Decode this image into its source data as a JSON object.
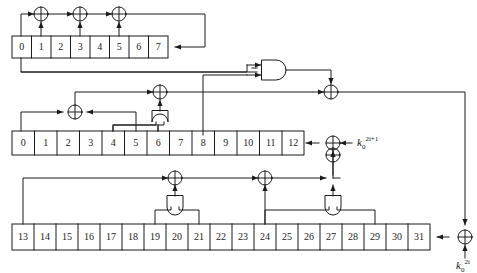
{
  "diagram": {
    "stroke_color": "#1a1a1a",
    "background": "#ffffff",
    "registers": [
      {
        "name": "top-register",
        "cells": [
          "0",
          "1",
          "2",
          "3",
          "4",
          "5",
          "6",
          "7"
        ]
      },
      {
        "name": "middle-register",
        "cells": [
          "0",
          "1",
          "2",
          "3",
          "4",
          "5",
          "6",
          "7",
          "8",
          "9",
          "10",
          "11",
          "12"
        ]
      },
      {
        "name": "bottom-register",
        "cells": [
          "13",
          "14",
          "15",
          "16",
          "17",
          "18",
          "19",
          "20",
          "21",
          "22",
          "23",
          "24",
          "25",
          "26",
          "27",
          "28",
          "29",
          "30",
          "31"
        ]
      }
    ],
    "gates": [
      {
        "name": "xor-top-1",
        "type": "xor",
        "symbol": "+"
      },
      {
        "name": "xor-top-2",
        "type": "xor",
        "symbol": "+"
      },
      {
        "name": "xor-top-3",
        "type": "xor",
        "symbol": "+"
      },
      {
        "name": "xor-middle-left",
        "type": "xor",
        "symbol": "+"
      },
      {
        "name": "xor-middle-center",
        "type": "xor",
        "symbol": "+"
      },
      {
        "name": "xor-middle-right",
        "type": "xor",
        "symbol": "+"
      },
      {
        "name": "xor-key-odd",
        "type": "xor",
        "symbol": "+"
      },
      {
        "name": "xor-bottom-left",
        "type": "xor",
        "symbol": "+"
      },
      {
        "name": "xor-bottom-center",
        "type": "xor",
        "symbol": "+"
      },
      {
        "name": "xor-bottom-right",
        "type": "xor",
        "symbol": "+"
      },
      {
        "name": "xor-key-even",
        "type": "xor",
        "symbol": "+"
      },
      {
        "name": "and-gate-top",
        "type": "and"
      },
      {
        "name": "and-gate-middle",
        "type": "and"
      },
      {
        "name": "and-gate-bottom-left",
        "type": "and"
      },
      {
        "name": "and-gate-bottom-right",
        "type": "and"
      }
    ],
    "labels": {
      "key_odd": {
        "base": "k",
        "sub": "0",
        "sup": "2i+1"
      },
      "key_even": {
        "base": "k",
        "sub": "0",
        "sup": "2i"
      }
    }
  }
}
